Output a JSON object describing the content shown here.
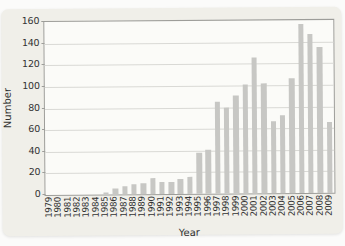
{
  "figure": {
    "page_bg": "#fbfbfa",
    "panel_bg": "#f0efe9"
  },
  "chart_data": {
    "type": "bar",
    "title": "",
    "xlabel": "Year",
    "ylabel": "Number",
    "categories": [
      "1979",
      "1980",
      "1981",
      "1982",
      "1983",
      "1984",
      "1985",
      "1986",
      "1987",
      "1988",
      "1989",
      "1990",
      "1991",
      "1992",
      "1993",
      "1994",
      "1995",
      "1996",
      "1997",
      "1998",
      "1999",
      "2000",
      "2001",
      "2002",
      "2003",
      "2004",
      "2005",
      "2006",
      "2007",
      "2008",
      "2009"
    ],
    "values": [
      0,
      0,
      0,
      0,
      0,
      0,
      2,
      6,
      7,
      9,
      10,
      15,
      11,
      11,
      14,
      16,
      38,
      41,
      85,
      80,
      91,
      101,
      126,
      102,
      67,
      72,
      106,
      156,
      147,
      135,
      66
    ],
    "ylim": [
      0,
      160
    ],
    "yticks": [
      0,
      20,
      40,
      60,
      80,
      100,
      120,
      140,
      160
    ],
    "grid": "horizontal",
    "legend": "none",
    "bar_color": "#c7c7c4",
    "grid_color": "#d9d9d5",
    "plot_bg": "#fbfbf8",
    "axis_border_color": "#9d9d99",
    "text_color": "#333333"
  }
}
